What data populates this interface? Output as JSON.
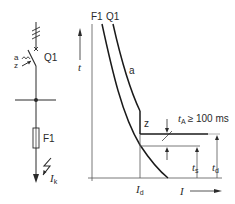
{
  "circuit": {
    "breaker_label": "Q1",
    "trip_a_label": "a",
    "trip_z_label": "z",
    "fuse_label": "F1",
    "fault_current_symbol": "I",
    "fault_current_sub": "k"
  },
  "chart": {
    "curve_labels": {
      "fuse": "F1",
      "breaker": "Q1"
    },
    "y_axis_symbol": "t",
    "x_axis_symbol": "I",
    "region_a_label": "a",
    "region_z_label": "z",
    "delay_symbol": "t",
    "delay_sub": "A",
    "delay_condition": "≥ 100 ms",
    "ts_symbol": "t",
    "ts_sub": "s",
    "td_symbol": "t",
    "td_sub": "d",
    "id_symbol": "I",
    "id_sub": "d"
  },
  "colors": {
    "line": "#2a2a2a",
    "thin": "#555555",
    "background": "#ffffff"
  }
}
